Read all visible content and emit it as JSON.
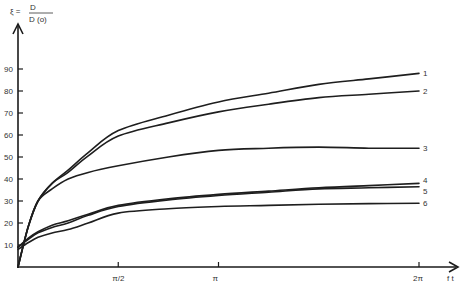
{
  "chart_data": {
    "type": "line",
    "ylabel_lhs": "ξ =",
    "ylabel_num": "D",
    "ylabel_den": "D (o)",
    "xlabel": "f t",
    "x_unit": "π",
    "xlim": [
      0,
      2.05
    ],
    "ylim": [
      0,
      100
    ],
    "grid": false,
    "legend_position": "inline-right",
    "y_ticks": [
      10,
      20,
      30,
      40,
      50,
      60,
      70,
      80,
      90
    ],
    "x_ticks": [
      {
        "value": 0.5,
        "label": "π/2"
      },
      {
        "value": 1,
        "label": "π"
      },
      {
        "value": 2,
        "label": "2π"
      }
    ],
    "series": [
      {
        "name": "1",
        "x": [
          0,
          0.05,
          0.1,
          0.17,
          0.25,
          0.35,
          0.5,
          0.75,
          1,
          1.25,
          1.5,
          1.75,
          2
        ],
        "values": [
          0,
          18,
          30,
          38,
          44,
          52,
          62,
          69,
          75,
          79,
          83,
          85.5,
          88
        ]
      },
      {
        "name": "2",
        "x": [
          0,
          0.05,
          0.1,
          0.17,
          0.25,
          0.35,
          0.5,
          0.75,
          1,
          1.25,
          1.5,
          1.75,
          2
        ],
        "values": [
          0,
          18,
          30,
          38,
          43,
          50.5,
          59.5,
          65.5,
          70.5,
          74,
          77,
          78.5,
          80
        ]
      },
      {
        "name": "3",
        "x": [
          0,
          0.05,
          0.1,
          0.17,
          0.25,
          0.35,
          0.5,
          0.75,
          1,
          1.25,
          1.5,
          1.75,
          2
        ],
        "values": [
          0,
          18,
          30,
          35.5,
          40,
          43,
          46,
          50,
          53,
          54,
          54.5,
          54,
          54
        ]
      },
      {
        "name": "4",
        "x": [
          0,
          0.05,
          0.1,
          0.17,
          0.25,
          0.35,
          0.5,
          0.75,
          1,
          1.25,
          1.5,
          1.75,
          2
        ],
        "values": [
          9,
          13,
          16,
          19,
          21,
          24,
          28,
          31,
          33,
          34.5,
          36,
          37,
          38
        ]
      },
      {
        "name": "5",
        "x": [
          0,
          0.05,
          0.1,
          0.17,
          0.25,
          0.35,
          0.5,
          0.75,
          1,
          1.25,
          1.5,
          1.75,
          2
        ],
        "values": [
          9,
          12.5,
          15.5,
          18,
          20,
          23.5,
          27.5,
          30.5,
          32.5,
          34,
          35.5,
          36,
          36.5
        ]
      },
      {
        "name": "6",
        "x": [
          0,
          0.05,
          0.1,
          0.17,
          0.25,
          0.35,
          0.5,
          0.75,
          1,
          1.25,
          1.5,
          1.75,
          2
        ],
        "values": [
          8,
          11,
          13.5,
          15.5,
          17,
          20,
          24.5,
          26.5,
          27.5,
          28,
          28.5,
          28.8,
          29
        ]
      }
    ]
  }
}
